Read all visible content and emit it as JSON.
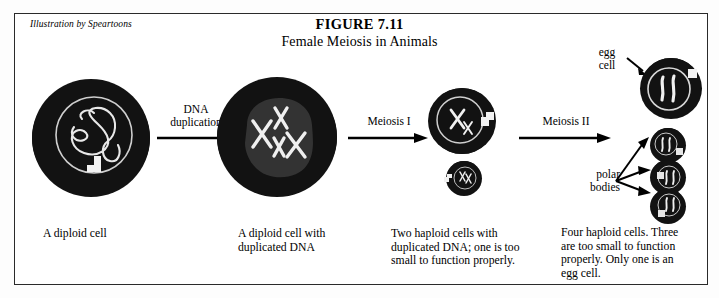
{
  "figure": {
    "credit": "Illustration by Speartoons",
    "title": "FIGURE 7.11",
    "subtitle": "Female Meiosis in Animals"
  },
  "stages": [
    {
      "id": "diploid",
      "caption_line1": "A diploid cell",
      "caption_line2": ""
    },
    {
      "id": "duplicated",
      "caption_line1": "A diploid cell with",
      "caption_line2": "duplicated DNA"
    },
    {
      "id": "two-haploid",
      "caption_line1": "Two haploid cells with",
      "caption_line2": "duplicated DNA; one is too",
      "caption_line3": "small to function properly."
    },
    {
      "id": "four-haploid",
      "caption_line1": "Four haploid cells.  Three",
      "caption_line2": "are too small to function",
      "caption_line3": "properly.  Only one is an",
      "caption_line4": "egg cell."
    }
  ],
  "transitions": [
    {
      "id": "dna-duplication",
      "line1": "DNA",
      "line2": "duplication"
    },
    {
      "id": "meiosis-1",
      "line1": "Meiosis I",
      "line2": ""
    },
    {
      "id": "meiosis-2",
      "line1": "Meiosis II",
      "line2": ""
    }
  ],
  "annotations": [
    {
      "id": "egg-cell",
      "line1": "egg",
      "line2": "cell"
    },
    {
      "id": "polar-bodies",
      "line1": "polar",
      "line2": "bodies"
    }
  ],
  "colors": {
    "cytoplasm": "#121212",
    "nucleus_fill": "#2e2e2e",
    "chromatin": "#e8e8e8",
    "frame": "#2a2a2a",
    "page": "#ffffff"
  }
}
